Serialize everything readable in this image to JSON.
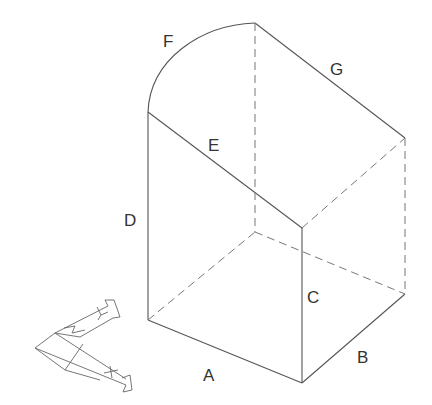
{
  "diagram": {
    "type": "isometric-solid",
    "line_color": "#555555",
    "hidden_line_color": "#777777",
    "labels": {
      "A": "A",
      "B": "B",
      "C": "C",
      "D": "D",
      "E": "E",
      "F": "F",
      "G": "G"
    },
    "ucs_icon": {
      "x_label": "X",
      "y_label": "Y",
      "z_label": "Z"
    }
  }
}
